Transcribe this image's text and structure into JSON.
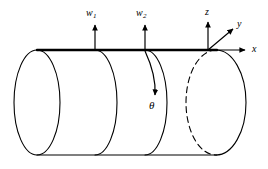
{
  "figure": {
    "background_color": "#ffffff",
    "stroke_color": "#000000"
  },
  "loads": [
    {
      "symbol": "w",
      "subscript": "1",
      "name": "load-w1",
      "x": 95,
      "arrow_tip_y": 24,
      "arrow_base_y": 50
    },
    {
      "symbol": "w",
      "subscript": "2",
      "name": "load-w2",
      "x": 145,
      "arrow_tip_y": 24,
      "arrow_base_y": 50
    }
  ],
  "axes": {
    "origin": {
      "x": 208,
      "y": 50
    },
    "items": [
      {
        "label": "z",
        "name": "axis-z",
        "direction": "up"
      },
      {
        "label": "y",
        "name": "axis-y",
        "direction": "up-right"
      },
      {
        "label": "x",
        "name": "axis-x",
        "direction": "right"
      }
    ]
  },
  "angle": {
    "label": "θ",
    "name": "angle-theta",
    "description": "circumferential angle measured around the shell"
  },
  "geometry": {
    "shell_type": "cylinder",
    "top_generator_line": {
      "x1": 37,
      "x2": 216,
      "y": 50,
      "bold": true
    },
    "bottom_generator_line": {
      "x1": 37,
      "x2": 216,
      "y": 155
    },
    "left_end_ellipse": {
      "cx": 37,
      "cy": 102.5,
      "rx": 23,
      "ry": 52.5,
      "style": "solid"
    },
    "right_end_ellipse": {
      "cx": 216,
      "cy": 102.5,
      "rx": 30,
      "ry": 52.5,
      "near_half": "solid",
      "far_half": "dashed"
    },
    "interior_rings": [
      {
        "cx": 95,
        "cy": 102.5,
        "rx": 22,
        "ry": 52.5,
        "name": "ring-at-w1"
      },
      {
        "cx": 145,
        "cy": 102.5,
        "rx": 22,
        "ry": 52.5,
        "name": "ring-at-w2"
      }
    ]
  }
}
